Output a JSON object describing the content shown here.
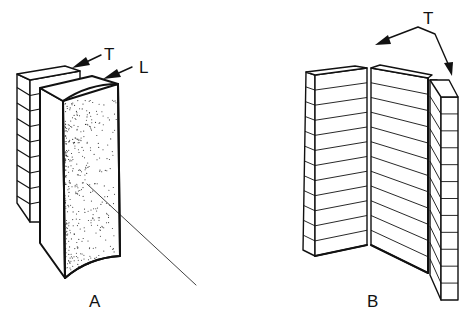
{
  "figure_a": {
    "label": "A",
    "arrow_labels": [
      "T",
      "L"
    ],
    "description": "Plank stack (T) and curved wedge with stippled surface (L)"
  },
  "figure_b": {
    "label": "B",
    "arrow_label": "T",
    "description": "Three layered panels split apart along tangential direction"
  },
  "colors": {
    "ink": "#111111",
    "background": "#ffffff"
  }
}
